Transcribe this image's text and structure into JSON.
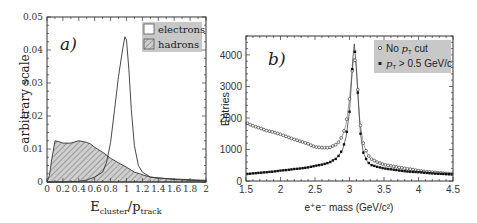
{
  "chart_data": [
    {
      "type": "area",
      "panel_label": "a)",
      "title": "",
      "xlabel_main": "E",
      "xlabel_sub1": "cluster",
      "xlabel_mid": "/p",
      "xlabel_sub2": "track",
      "xlabel": "E_cluster / p_track",
      "ylabel": "arbitrary scale",
      "xlim": [
        0,
        2
      ],
      "ylim": [
        0,
        0.05
      ],
      "xticks": [
        0,
        0.2,
        0.4,
        0.6,
        0.8,
        1,
        1.2,
        1.4,
        1.6,
        1.8,
        2
      ],
      "xtick_labels": [
        "0",
        "0.2",
        "0.4",
        "0.6",
        "0.8",
        "1",
        "1.2",
        "1.4",
        "1.6",
        "1.8",
        "2"
      ],
      "yticks": [
        0,
        0.01,
        0.02,
        0.03,
        0.04,
        0.05
      ],
      "ytick_labels": [
        "0",
        "0.01",
        "0.02",
        "0.03",
        "0.04",
        "0.05"
      ],
      "grid": false,
      "legend_position": "upper right",
      "legend": [
        {
          "label": "electrons",
          "style": "open"
        },
        {
          "label": "hadrons",
          "style": "hatched"
        }
      ],
      "series": [
        {
          "name": "electrons",
          "x": [
            0.0,
            0.2,
            0.4,
            0.5,
            0.6,
            0.7,
            0.75,
            0.8,
            0.85,
            0.9,
            0.95,
            0.98,
            1.0,
            1.03,
            1.06,
            1.1,
            1.15,
            1.2,
            1.3,
            1.4,
            1.6,
            1.8,
            2.0
          ],
          "values": [
            0.0,
            0.0,
            0.0002,
            0.0006,
            0.0015,
            0.003,
            0.006,
            0.012,
            0.022,
            0.032,
            0.04,
            0.044,
            0.043,
            0.034,
            0.022,
            0.011,
            0.005,
            0.003,
            0.0015,
            0.0012,
            0.0008,
            0.0005,
            0.0003
          ]
        },
        {
          "name": "hadrons",
          "x": [
            0.0,
            0.03,
            0.06,
            0.1,
            0.15,
            0.2,
            0.3,
            0.4,
            0.5,
            0.55,
            0.6,
            0.7,
            0.8,
            0.9,
            1.0,
            1.1,
            1.2,
            1.3,
            1.4,
            1.6,
            1.8,
            2.0
          ],
          "values": [
            0.0,
            0.002,
            0.007,
            0.0125,
            0.0122,
            0.0118,
            0.0118,
            0.0125,
            0.012,
            0.0115,
            0.0105,
            0.009,
            0.0072,
            0.0058,
            0.0045,
            0.003,
            0.0022,
            0.0015,
            0.0012,
            0.0009,
            0.0007,
            0.0005
          ]
        }
      ]
    },
    {
      "type": "scatter",
      "panel_label": "b)",
      "title": "",
      "xlabel": "e⁺e⁻ mass  (GeV/c²)",
      "ylabel": "Entries",
      "xlim": [
        1.5,
        4.5
      ],
      "ylim": [
        0,
        4600
      ],
      "xticks": [
        1.5,
        2,
        2.5,
        3,
        3.5,
        4,
        4.5
      ],
      "xtick_labels": [
        "1.5",
        "2",
        "2.5",
        "3",
        "3.5",
        "4",
        "4.5"
      ],
      "yticks": [
        0,
        1000,
        2000,
        3000,
        4000
      ],
      "ytick_labels": [
        "0",
        "1000",
        "2000",
        "3000",
        "4000"
      ],
      "grid": false,
      "legend_position": "upper right",
      "legend": [
        {
          "label": "No p_T cut",
          "marker": "open-circle"
        },
        {
          "label": "p_T > 0.5 GeV/c",
          "marker": "filled-square"
        }
      ],
      "legend_text": {
        "no_cut_pre": "No ",
        "no_cut_var": "p",
        "no_cut_sub": "T",
        "no_cut_post": " cut",
        "cut_var": "p",
        "cut_sub": "T",
        "cut_post": " > 0.5 GeV/c"
      },
      "series": [
        {
          "name": "No p_T cut",
          "x": [
            1.5,
            1.6,
            1.7,
            1.8,
            1.9,
            2.0,
            2.1,
            2.2,
            2.3,
            2.4,
            2.5,
            2.6,
            2.7,
            2.8,
            2.85,
            2.9,
            2.95,
            3.0,
            3.03,
            3.06,
            3.09,
            3.12,
            3.15,
            3.2,
            3.25,
            3.3,
            3.4,
            3.5,
            3.6,
            3.7,
            3.8,
            3.9,
            4.0,
            4.1,
            4.2,
            4.3,
            4.4,
            4.5
          ],
          "values": [
            1850,
            1750,
            1680,
            1600,
            1550,
            1480,
            1400,
            1320,
            1250,
            1180,
            1080,
            1060,
            1050,
            1150,
            1250,
            1450,
            1800,
            2600,
            3300,
            3900,
            3800,
            2900,
            1900,
            1200,
            900,
            720,
            600,
            520,
            480,
            440,
            400,
            370,
            330,
            300,
            280,
            260,
            240,
            230
          ]
        },
        {
          "name": "p_T > 0.5 GeV/c",
          "x": [
            1.5,
            1.6,
            1.7,
            1.8,
            1.9,
            2.0,
            2.1,
            2.2,
            2.3,
            2.4,
            2.5,
            2.6,
            2.7,
            2.8,
            2.85,
            2.9,
            2.95,
            3.0,
            3.03,
            3.05,
            3.07,
            3.1,
            3.13,
            3.16,
            3.2,
            3.25,
            3.3,
            3.4,
            3.5,
            3.6,
            3.7,
            3.8,
            3.9,
            4.0,
            4.1,
            4.2,
            4.3,
            4.4,
            4.5
          ],
          "values": [
            220,
            240,
            260,
            280,
            300,
            330,
            350,
            380,
            400,
            430,
            480,
            520,
            580,
            700,
            820,
            1000,
            1400,
            2200,
            3200,
            3900,
            4350,
            3600,
            2400,
            1500,
            900,
            650,
            520,
            450,
            400,
            370,
            340,
            310,
            290,
            280,
            260,
            240,
            230,
            220,
            210
          ]
        }
      ]
    }
  ]
}
